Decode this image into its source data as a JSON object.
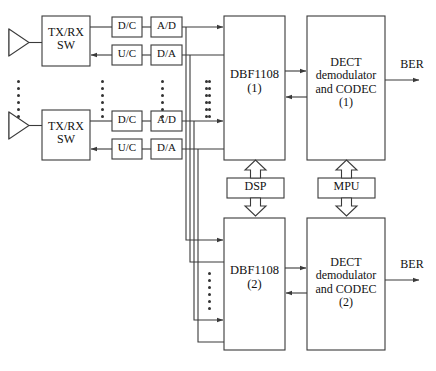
{
  "diagram": {
    "stroke_color": "#3a3a3a",
    "text_color": "#111111",
    "background": "#ffffff"
  },
  "antennas": [
    {
      "name": "antenna-1"
    },
    {
      "name": "antenna-2"
    }
  ],
  "switches": [
    {
      "label": "TX/RX\nSW"
    },
    {
      "label": "TX/RX\nSW"
    }
  ],
  "rf_chain": {
    "rx_path": [
      {
        "label": "D/C"
      },
      {
        "label": "A/D"
      }
    ],
    "tx_path": [
      {
        "label": "U/C"
      },
      {
        "label": "D/A"
      }
    ]
  },
  "branch_1": {
    "downconverter": "D/C",
    "adc": "A/D",
    "upconverter": "U/C",
    "dac": "D/A"
  },
  "branch_2": {
    "downconverter": "D/C",
    "adc": "A/D",
    "upconverter": "U/C",
    "dac": "D/A"
  },
  "beamformers": [
    {
      "label": "DBF1108\n(1)",
      "name": "dbf1108-1"
    },
    {
      "label": "DBF1108\n(2)",
      "name": "dbf1108-2"
    }
  ],
  "codecs": [
    {
      "label": "DECT\ndemodulator\nand CODEC\n(1)",
      "name": "dect-codec-1"
    },
    {
      "label": "DECT\ndemodulator\nand CODEC\n(2)",
      "name": "dect-codec-2"
    }
  ],
  "controllers": {
    "dsp": "DSP",
    "mpu": "MPU"
  },
  "outputs": [
    {
      "label": "BER",
      "name": "ber-output-1"
    },
    {
      "label": "BER",
      "name": "ber-output-2"
    }
  ],
  "ellipses": {
    "antenna_column": "vertical-ellipsis",
    "switch_column": "vertical-ellipsis",
    "converter_column": "vertical-ellipsis",
    "bus_column": "vertical-ellipsis",
    "dbf1_column": "vertical-ellipsis",
    "dbf2_column": "vertical-ellipsis"
  }
}
